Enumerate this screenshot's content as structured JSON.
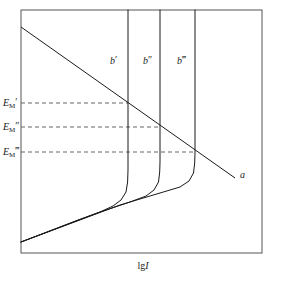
{
  "figure": {
    "title": "",
    "axis_label_x": {
      "operator": "lg",
      "variable": "I"
    },
    "frame_color": "#555555",
    "curve_color": "#1a1a1a",
    "dashed_color": "#666666"
  },
  "y_ticks": [
    {
      "id": "em-1",
      "base": "E",
      "subscript": "M",
      "primes": "′"
    },
    {
      "id": "em-2",
      "base": "E",
      "subscript": "M",
      "primes": "″"
    },
    {
      "id": "em-3",
      "base": "E",
      "subscript": "M",
      "primes": "‴"
    }
  ],
  "curve_labels": [
    {
      "id": "b-1",
      "base": "b",
      "primes": "′"
    },
    {
      "id": "b-2",
      "base": "b",
      "primes": "″"
    },
    {
      "id": "b-3",
      "base": "b",
      "primes": "‴"
    }
  ],
  "line_labels": [
    {
      "id": "line-a",
      "text": "a"
    }
  ],
  "chart_data": {
    "type": "line",
    "title": "",
    "xlabel": "lg I",
    "ylabel": "",
    "grid": false,
    "legend": "inline-annotations",
    "axis_frame": {
      "x0": 21,
      "y0": 10,
      "x1": 262,
      "y1": 253
    },
    "xlim": [
      21,
      262
    ],
    "ylim": [
      253,
      10
    ],
    "series": [
      {
        "name": "a",
        "kind": "cathodic-polarization-line",
        "style": "solid",
        "points": [
          [
            21,
            27
          ],
          [
            235,
            178
          ]
        ]
      },
      {
        "name": "b'",
        "kind": "anodic-polarization-curve",
        "style": "solid",
        "vertical_x": 128,
        "points": [
          [
            21,
            242
          ],
          [
            95,
            214
          ],
          [
            112,
            207
          ],
          [
            122,
            201
          ],
          [
            127,
            192
          ],
          [
            128,
            175
          ],
          [
            128,
            10
          ]
        ]
      },
      {
        "name": "b''",
        "kind": "anodic-polarization-curve",
        "style": "solid",
        "vertical_x": 160,
        "points": [
          [
            21,
            242
          ],
          [
            120,
            205
          ],
          [
            142,
            199
          ],
          [
            154,
            194
          ],
          [
            159,
            186
          ],
          [
            160,
            172
          ],
          [
            160,
            10
          ]
        ]
      },
      {
        "name": "b'''",
        "kind": "anodic-polarization-curve",
        "style": "solid",
        "vertical_x": 195,
        "points": [
          [
            21,
            242
          ],
          [
            150,
            195
          ],
          [
            175,
            190
          ],
          [
            188,
            185
          ],
          [
            194,
            177
          ],
          [
            195,
            163
          ],
          [
            195,
            10
          ]
        ]
      }
    ],
    "annotations": [
      {
        "label": "E'_M",
        "style": "dashed",
        "y": 103,
        "x_from": 21,
        "x_to": 128,
        "marks_intersection_with": "b'"
      },
      {
        "label": "E''_M",
        "style": "dashed",
        "y": 127,
        "x_from": 21,
        "x_to": 160,
        "marks_intersection_with": "b''"
      },
      {
        "label": "E'''_M",
        "style": "dashed",
        "y": 152,
        "x_from": 21,
        "x_to": 195,
        "marks_intersection_with": "b'''"
      }
    ]
  }
}
